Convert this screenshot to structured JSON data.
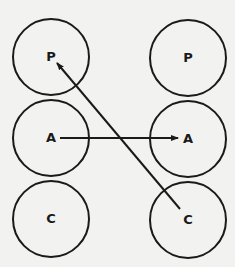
{
  "diagram": {
    "type": "two-column node mapping",
    "colors": {
      "background": "#f2f2f0",
      "stroke": "#1a1a1a"
    },
    "left_column": {
      "nodes": [
        {
          "label": "P",
          "cx": 51,
          "cy": 57,
          "r": 38
        },
        {
          "label": "A",
          "cx": 51,
          "cy": 138,
          "r": 38
        },
        {
          "label": "C",
          "cx": 51,
          "cy": 219,
          "r": 38
        }
      ]
    },
    "right_column": {
      "nodes": [
        {
          "label": "P",
          "cx": 188,
          "cy": 58,
          "r": 38
        },
        {
          "label": "A",
          "cx": 188,
          "cy": 139,
          "r": 38
        },
        {
          "label": "C",
          "cx": 188,
          "cy": 220,
          "r": 38
        }
      ]
    },
    "arrows": [
      {
        "from": "left.A",
        "to": "right.A",
        "x1": 60,
        "y1": 138,
        "x2": 178,
        "y2": 138
      },
      {
        "from": "right.C",
        "to": "left.P",
        "x1": 180,
        "y1": 209,
        "x2": 57,
        "y2": 63
      }
    ]
  }
}
